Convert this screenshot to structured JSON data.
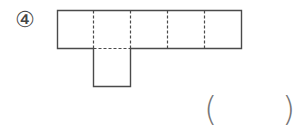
{
  "problem": {
    "number_label": "④",
    "answer_open": "(",
    "answer_close": ")",
    "answer_value": ""
  },
  "net": {
    "description": "Net of a cube-like shape: row of 5 squares with one square attached below the second",
    "top_row_squares": 5,
    "bottom_square_under_index": 2,
    "line_color": "#444444",
    "fold_lines": "dashed"
  }
}
